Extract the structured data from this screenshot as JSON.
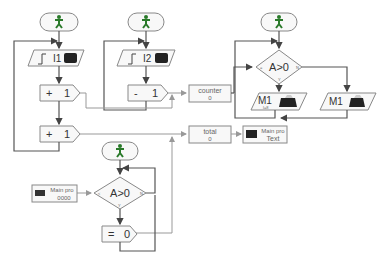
{
  "diagram": {
    "processes": [
      {
        "id": "p1",
        "start_icon": "running-man-icon",
        "input": {
          "label": "I1",
          "icon": "pushbutton-icon"
        },
        "ops": [
          {
            "op": "+",
            "value": "1"
          },
          {
            "op": "+",
            "value": "1"
          }
        ]
      },
      {
        "id": "p2",
        "start_icon": "running-man-icon",
        "input": {
          "label": "I2",
          "icon": "pushbutton-icon"
        },
        "ops": [
          {
            "op": "-",
            "value": "1"
          }
        ]
      },
      {
        "id": "p3",
        "start_icon": "running-man-icon",
        "decision": {
          "label": "A>0",
          "left": "=",
          "right": "N",
          "bottom": "Y"
        },
        "outputs": [
          {
            "label": "M1",
            "sub": "l=8",
            "icon": "motor-icon"
          },
          {
            "label": "M1",
            "icon": "motor-icon"
          }
        ]
      },
      {
        "id": "p4",
        "start_icon": "running-man-icon",
        "decision": {
          "label": "A>0",
          "left": "<",
          "right": "N",
          "bottom": "Y"
        },
        "ops": [
          {
            "op": "=",
            "value": "0"
          }
        ]
      }
    ],
    "variables": [
      {
        "name": "counter",
        "value": "0"
      },
      {
        "name": "total",
        "value": "0"
      }
    ],
    "displays": [
      {
        "title": "Main pro",
        "value": "Text"
      },
      {
        "title": "Main pro",
        "value": "0000"
      }
    ]
  }
}
